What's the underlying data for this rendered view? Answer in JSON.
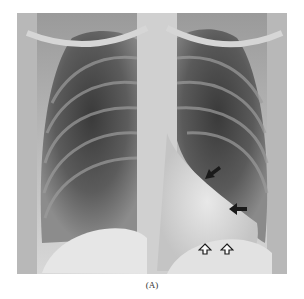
{
  "figure": {
    "label": "(A)",
    "annotations": [
      {
        "type": "solid-arrow",
        "direction": "down-left",
        "x": 210,
        "y": 172
      },
      {
        "type": "solid-arrow",
        "direction": "left",
        "x": 237,
        "y": 209
      },
      {
        "type": "open-arrow",
        "direction": "up",
        "x": 205,
        "y": 238
      },
      {
        "type": "open-arrow",
        "direction": "up",
        "x": 227,
        "y": 238
      }
    ]
  }
}
